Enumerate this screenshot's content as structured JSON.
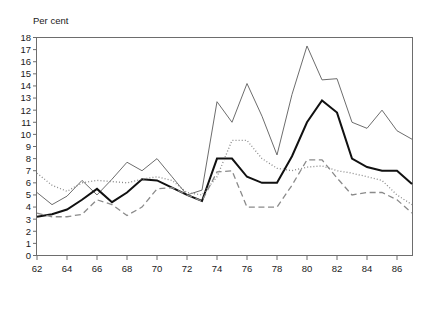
{
  "chart_data": {
    "type": "line",
    "title": "",
    "subtitle": "",
    "xlabel": "",
    "ylabel": "Per cent",
    "ylabel_position": "top-left",
    "grid": false,
    "legend_position": "bottom",
    "xlim": [
      62,
      87
    ],
    "ylim": [
      0,
      18
    ],
    "x_ticks": [
      62,
      64,
      66,
      68,
      70,
      72,
      74,
      76,
      78,
      80,
      82,
      84,
      86
    ],
    "x_tick_labels": [
      "62",
      "64",
      "66",
      "68",
      "70",
      "72",
      "74",
      "76",
      "78",
      "80",
      "82",
      "84",
      "86"
    ],
    "y_ticks": [
      0,
      1,
      2,
      3,
      4,
      5,
      6,
      7,
      8,
      9,
      10,
      11,
      12,
      13,
      14,
      15,
      16,
      17,
      18
    ],
    "y_tick_labels": [
      "0",
      "1",
      "2",
      "3",
      "4",
      "5",
      "6",
      "7",
      "8",
      "9",
      "10",
      "11",
      "12",
      "13",
      "14",
      "15",
      "16",
      "17",
      "18"
    ],
    "x": [
      62,
      63,
      64,
      65,
      66,
      67,
      68,
      69,
      70,
      71,
      72,
      73,
      74,
      75,
      76,
      77,
      78,
      79,
      80,
      81,
      82,
      83,
      84,
      85,
      86,
      87
    ],
    "series": [
      {
        "name": "UK",
        "style": "solid-thin",
        "color": "#6d6d6d",
        "width": 1,
        "values": [
          5.2,
          4.2,
          4.9,
          6.2,
          5.0,
          6.3,
          7.7,
          7.0,
          8.0,
          6.5,
          5.0,
          5.4,
          12.7,
          11.0,
          14.2,
          11.5,
          8.3,
          13.3,
          17.3,
          14.5,
          14.6,
          11.0,
          10.5,
          12.0,
          10.3,
          9.6
        ]
      },
      {
        "name": "USA",
        "style": "solid-thick",
        "color": "#111111",
        "width": 2,
        "values": [
          3.2,
          3.4,
          3.8,
          4.6,
          5.5,
          4.4,
          5.2,
          6.3,
          6.2,
          5.6,
          5.0,
          4.5,
          8.0,
          8.0,
          6.5,
          6.0,
          6.0,
          8.2,
          11.0,
          12.8,
          11.8,
          8.0,
          7.3,
          7.0,
          7.0,
          5.9
        ]
      },
      {
        "name": "Japan",
        "style": "dotted",
        "color": "#8a8a8a",
        "width": 1.3,
        "values": [
          6.8,
          5.8,
          5.3,
          6.0,
          6.2,
          6.1,
          6.0,
          6.3,
          6.5,
          6.2,
          5.2,
          5.0,
          6.5,
          9.5,
          9.5,
          8.0,
          7.2,
          7.0,
          7.3,
          7.4,
          7.0,
          6.8,
          6.5,
          6.2,
          5.0,
          4.2
        ]
      },
      {
        "name": "West Germany",
        "style": "dashed",
        "color": "#8a8a8a",
        "width": 1.3,
        "values": [
          3.5,
          3.2,
          3.2,
          3.4,
          4.6,
          4.2,
          3.3,
          4.0,
          5.5,
          5.6,
          5.0,
          4.5,
          6.9,
          7.0,
          4.0,
          4.0,
          4.0,
          5.8,
          7.9,
          7.9,
          6.4,
          5.0,
          5.2,
          5.2,
          4.6,
          3.5
        ]
      }
    ]
  },
  "axis": {
    "y_title": "Per cent"
  },
  "legend": {
    "items": [
      {
        "label": "UK",
        "style": "solid-thin"
      },
      {
        "label": "USA",
        "style": "solid-thick"
      },
      {
        "label": "Japan",
        "style": "dotted"
      },
      {
        "label": "West Germany",
        "style": "dashed"
      }
    ]
  }
}
